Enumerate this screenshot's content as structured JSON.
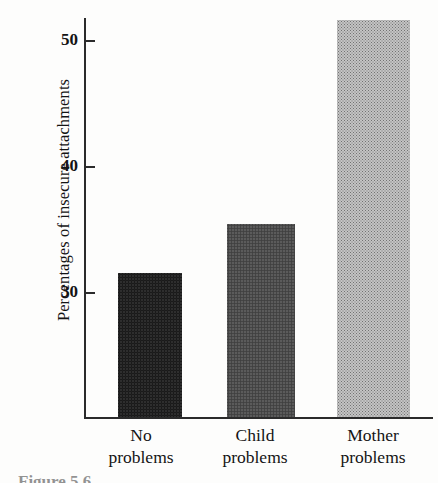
{
  "figure": {
    "caption_partial": "Figure 5.6",
    "background_color": "#fdfdfc",
    "axis_color": "#2b2b2b"
  },
  "chart_data": {
    "type": "bar",
    "title": "",
    "xlabel": "",
    "ylabel": "Percentages of insecure attachments",
    "categories": [
      "No problems",
      "Child problems",
      "Mother problems"
    ],
    "category_lines": [
      {
        "line1": "No",
        "line2": "problems"
      },
      {
        "line1": "Child",
        "line2": "problems"
      },
      {
        "line1": "Mother",
        "line2": "problems"
      }
    ],
    "values": [
      31.5,
      35.4,
      51.6
    ],
    "ylim": [
      22.0,
      53.0
    ],
    "yticks": [
      30,
      40,
      50
    ],
    "ytick_labels": [
      "30",
      "40",
      "50"
    ],
    "tick_direction": "inward",
    "grid": false,
    "legend": false,
    "bar_colors": [
      "#5d5d5d",
      "#8d8d8d",
      "#c4c4c4"
    ],
    "bar_textures": [
      "halftone-dark",
      "halftone-medium",
      "halftone-light"
    ]
  }
}
